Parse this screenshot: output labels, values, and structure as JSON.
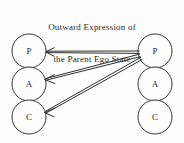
{
  "figure": {
    "title": {
      "line1": "Outward Expression of",
      "line2": "the Parent Ego State"
    },
    "background_color": "#fdfdfc",
    "stroke_color": "#2e2e2e",
    "width": 184,
    "height": 143
  },
  "columns": [
    {
      "id": "left",
      "role": "receiver",
      "center_x": 29,
      "radius": 17,
      "states": [
        {
          "key": "parent",
          "label": "P",
          "center_y": 51
        },
        {
          "key": "adult",
          "label": "A",
          "center_y": 84
        },
        {
          "key": "child",
          "label": "C",
          "center_y": 117
        }
      ]
    },
    {
      "id": "right",
      "role": "sender",
      "center_x": 155,
      "radius": 17,
      "states": [
        {
          "key": "parent",
          "label": "P",
          "center_y": 51
        },
        {
          "key": "adult",
          "label": "A",
          "center_y": 84
        },
        {
          "key": "child",
          "label": "C",
          "center_y": 117
        }
      ]
    }
  ],
  "transactions": [
    {
      "name": "parent-to-parent",
      "from": "right.parent",
      "to": "left.parent",
      "style": "double-line",
      "from_point": [
        139,
        52
      ],
      "to_point": [
        46,
        52
      ]
    },
    {
      "name": "parent-to-adult",
      "from": "right.parent",
      "to": "left.adult",
      "style": "double-line",
      "from_point": [
        140,
        55
      ],
      "to_point": [
        45,
        79
      ]
    },
    {
      "name": "parent-to-child",
      "from": "right.parent",
      "to": "left.child",
      "style": "double-line",
      "from_point": [
        141,
        58
      ],
      "to_point": [
        45,
        112
      ]
    }
  ]
}
